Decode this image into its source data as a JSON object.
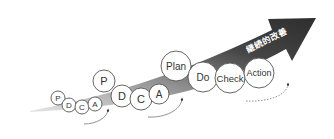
{
  "diagram": {
    "arrow_label": "継続的改善",
    "colors": {
      "arrow_dark": "#3a3a3a",
      "arrow_light": "#c8c8c8",
      "circle_stroke": "#555555",
      "text": "#333333"
    },
    "cycles": [
      {
        "name": "small",
        "steps": [
          {
            "label": "P"
          },
          {
            "label": "D"
          },
          {
            "label": "C"
          },
          {
            "label": "A"
          }
        ]
      },
      {
        "name": "medium",
        "steps": [
          {
            "label": "P"
          },
          {
            "label": "D"
          },
          {
            "label": "C"
          },
          {
            "label": "A"
          }
        ]
      },
      {
        "name": "large",
        "steps": [
          {
            "label": "Plan"
          },
          {
            "label": "Do"
          },
          {
            "label": "Check"
          },
          {
            "label": "Action"
          }
        ]
      }
    ]
  }
}
